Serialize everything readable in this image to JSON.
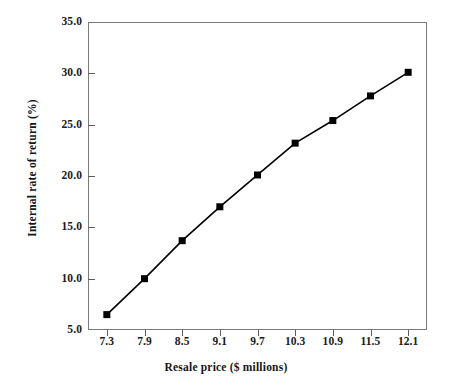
{
  "chart_data": {
    "type": "line",
    "title": "",
    "xlabel": "Resale price ($ millions)",
    "ylabel": "Internal rate of return (%)",
    "x": [
      7.3,
      7.9,
      8.5,
      9.1,
      9.7,
      10.3,
      10.9,
      11.5,
      12.1
    ],
    "values": [
      6.5,
      10.0,
      13.7,
      17.0,
      20.1,
      23.2,
      25.4,
      27.8,
      30.1
    ],
    "series": [
      {
        "name": "Internal rate of return",
        "values": [
          6.5,
          10.0,
          13.7,
          17.0,
          20.1,
          23.2,
          25.4,
          27.8,
          30.1
        ],
        "color": "#000000",
        "marker": "square"
      }
    ],
    "xtick_labels": [
      "7.3",
      "7.9",
      "8.5",
      "9.1",
      "9.7",
      "10.3",
      "10.9",
      "11.5",
      "12.1"
    ],
    "ytick_labels": [
      "5.0",
      "10.0",
      "15.0",
      "20.0",
      "25.0",
      "30.0",
      "35.0"
    ],
    "yticks": [
      5.0,
      10.0,
      15.0,
      20.0,
      25.0,
      30.0,
      35.0
    ],
    "ylim": [
      5.0,
      35.0
    ],
    "xlim": [
      7.0,
      12.4
    ],
    "grid": false,
    "legend": "none",
    "line_color": "#000000",
    "marker_color": "#000000",
    "frame_color": "#7a7a7a",
    "background": "#ffffff"
  }
}
